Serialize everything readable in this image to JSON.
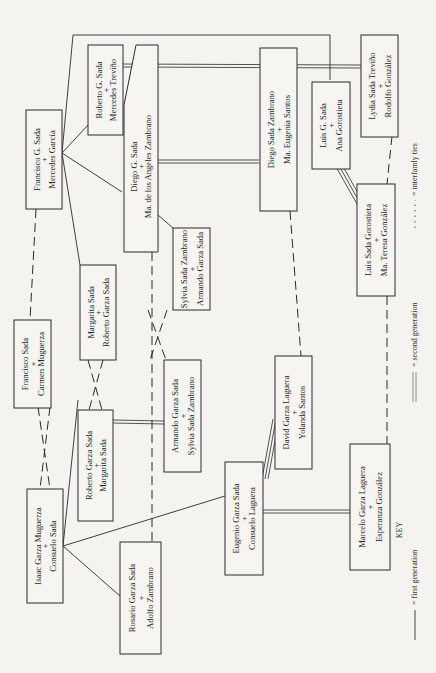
{
  "diagram": {
    "orientation": "rotated 90° counter-clockwise",
    "couples": [
      {
        "id": "francisco-g-sada",
        "line1": "Francisco G. Sada",
        "plus": "+",
        "line2": "Mercedes García"
      },
      {
        "id": "roberto-g-sada",
        "line1": "Roberto G. Sada",
        "plus": "+",
        "line2": "Mercedes Treviño"
      },
      {
        "id": "diego-g-sada",
        "line1": "Diego G. Sada",
        "plus": "+",
        "line2": "Ma. de los Angeles Zambrano"
      },
      {
        "id": "sylvia-sada-zambrano",
        "line1": "Sylvia Sada Zambrano",
        "plus": "+",
        "line2": "Armando Garza Sada"
      },
      {
        "id": "diego-sada-zambrano",
        "line1": "Diego Sada Zambrano",
        "plus": "+",
        "line2": "Ma. Eugenia Santos"
      },
      {
        "id": "luis-g-sada",
        "line1": "Luis G. Sada",
        "plus": "+",
        "line2": "Ana Gorostieta"
      },
      {
        "id": "lydia-sada-trevino",
        "line1": "Lydia Sada Treviño",
        "plus": "+",
        "line2": "Rodolfo González"
      },
      {
        "id": "luis-sada-gorostieta",
        "line1": "Luis Sada Gorostieta",
        "plus": "+",
        "line2": "Ma. Teresa González"
      },
      {
        "id": "francisco-sada",
        "line1": "Francisco Sada",
        "plus": "+",
        "line2": "Carmen Muguerza"
      },
      {
        "id": "margarita-sada",
        "line1": "Margarita Sada",
        "plus": "+",
        "line2": "Roberto Garza Sada"
      },
      {
        "id": "roberto-garza-sada",
        "line1": "Roberto Garza Sada",
        "plus": "+",
        "line2": "Margarita Sada"
      },
      {
        "id": "armando-garza-sada",
        "line1": "Armando Garza Sada",
        "plus": "+",
        "line2": "Sylvia Sada Zambrano"
      },
      {
        "id": "isaac-garza-muguerza",
        "line1": "Isaac Garza Muguerza",
        "plus": "+",
        "line2": "Consuelo Sada"
      },
      {
        "id": "rosario-garza-sada",
        "line1": "Rosario Garza Sada",
        "plus": "+",
        "line2": "Adolfo Zambrano"
      },
      {
        "id": "eugenio-garza-sada",
        "line1": "Eugenio Garza Sada",
        "plus": "+",
        "line2": "Consuelo Laguera"
      },
      {
        "id": "david-garza-laguera",
        "line1": "David Garza Laguera",
        "plus": "+",
        "line2": "Yolanda Santos"
      },
      {
        "id": "marcelo-garza-laguera",
        "line1": "Marcelo Garza Laguera",
        "plus": "+",
        "line2": "Esperanza González"
      }
    ]
  },
  "key": {
    "title": "KEY",
    "first_generation": "= first generation",
    "second_generation": "= second generation",
    "interfamily_ties": "= interfamly ties"
  }
}
